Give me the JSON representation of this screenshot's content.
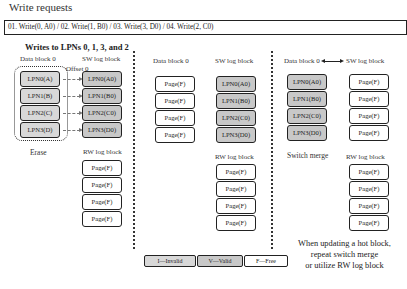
{
  "title": "Write requests",
  "requests": "01. Write(0, A0) / 02. Write(1, B0) / 03. Write(3, D0) / 04. Write(2, C0)",
  "subtitle": "Writes to LPNs 0, 1, 3, and 2",
  "colors": {
    "valid": "#c8c8c8",
    "invalid": "#d8d8d8",
    "free": "#ffffff",
    "border": "#222222"
  },
  "panel1": {
    "data_block_label": "Data block 0",
    "sw_log_label": "SW log block",
    "offset_label": "Offset 0",
    "erase_label": "Erase",
    "rw_log_label": "RW log block",
    "data_block": [
      "LPN0(A)",
      "LPN1(B)",
      "LPN2(C)",
      "LPN3(D)"
    ],
    "sw_log": [
      "LPN0(A0)",
      "LPN1(B0)",
      "LPN2(C0)",
      "LPN3(D0)"
    ],
    "rw_log": [
      "Page(F)",
      "Page(F)",
      "Page(F)",
      "Page(F)"
    ]
  },
  "panel2": {
    "data_block_label": "Data block 0",
    "sw_log_label": "SW log block",
    "rw_log_label": "RW log block",
    "data_block": [
      "Page(F)",
      "Page(F)",
      "Page(F)",
      "Page(F)"
    ],
    "sw_log": [
      "LPN0(A0)",
      "LPN1(B0)",
      "LPN2(C0)",
      "LPN3(D0)"
    ],
    "rw_log": [
      "Page(F)",
      "Page(F)",
      "Page(F)",
      "Page(F)"
    ]
  },
  "panel3": {
    "data_block_label": "Data block 0",
    "sw_log_label": "SW log block",
    "switch_label": "Switch merge",
    "rw_log_label": "RW log block",
    "data_block": [
      "LPN0(A0)",
      "LPN1(B0)",
      "LPN2(C0)",
      "LPN3(D0)"
    ],
    "sw_log": [
      "Page(F)",
      "Page(F)",
      "Page(F)",
      "Page(F)"
    ],
    "rw_log": [
      "Page(F)",
      "Page(F)",
      "Page(F)",
      "Page(F)"
    ]
  },
  "legend": [
    {
      "label": "I—Invalid"
    },
    {
      "label": "V—Valid"
    },
    {
      "label": "F—Free"
    }
  ],
  "caption": {
    "line1": "When updating a hot block,",
    "line2": "repeat switch merge",
    "line3": "or utilize RW log block"
  }
}
